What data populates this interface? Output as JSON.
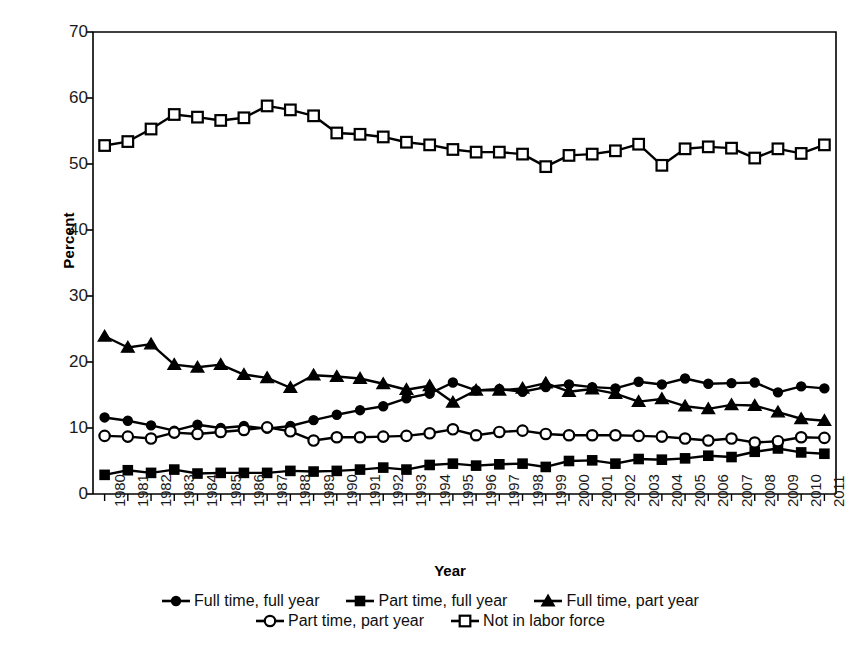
{
  "chart_data": {
    "type": "line",
    "title": "",
    "xlabel": "Year",
    "ylabel": "Percent",
    "ylim": [
      0,
      70
    ],
    "yticks": [
      0,
      10,
      20,
      30,
      40,
      50,
      60,
      70
    ],
    "grid": false,
    "legend_position": "bottom",
    "categories": [
      "1980",
      "1981",
      "1982",
      "1983",
      "1984",
      "1985",
      "1986",
      "1987",
      "1988",
      "1989",
      "1990",
      "1991",
      "1992",
      "1993",
      "1994",
      "1995",
      "1996",
      "1997",
      "1998",
      "1999",
      "2000",
      "2001",
      "2002",
      "2003",
      "2004",
      "2005",
      "2006",
      "2007",
      "2008",
      "2009",
      "2010",
      "2011"
    ],
    "series": [
      {
        "name": "Full time, full year",
        "marker": "filled-circle",
        "values": [
          11.6,
          11.1,
          10.4,
          9.6,
          10.5,
          10.0,
          10.3,
          9.9,
          10.3,
          11.2,
          12.0,
          12.7,
          13.3,
          14.5,
          15.2,
          16.9,
          15.7,
          15.9,
          15.5,
          16.2,
          16.6,
          16.2,
          16.0,
          17.0,
          16.6,
          17.5,
          16.7,
          16.8,
          16.9,
          15.4,
          16.3,
          16.0
        ]
      },
      {
        "name": "Part time, full year",
        "marker": "filled-square",
        "values": [
          2.9,
          3.6,
          3.2,
          3.7,
          3.1,
          3.2,
          3.2,
          3.2,
          3.5,
          3.4,
          3.5,
          3.7,
          4.0,
          3.7,
          4.4,
          4.6,
          4.3,
          4.5,
          4.6,
          4.1,
          5.0,
          5.1,
          4.6,
          5.3,
          5.2,
          5.4,
          5.8,
          5.6,
          6.4,
          6.9,
          6.3,
          6.1
        ]
      },
      {
        "name": "Full time, part year",
        "marker": "filled-triangle",
        "values": [
          23.9,
          22.2,
          22.7,
          19.6,
          19.2,
          19.6,
          18.1,
          17.6,
          16.1,
          18.0,
          17.8,
          17.5,
          16.7,
          15.8,
          16.4,
          13.9,
          15.7,
          15.7,
          16.0,
          16.8,
          15.5,
          15.9,
          15.2,
          14.0,
          14.4,
          13.3,
          12.9,
          13.5,
          13.4,
          12.4,
          11.4,
          11.1
        ]
      },
      {
        "name": "Part time, part year",
        "marker": "open-circle",
        "values": [
          8.8,
          8.7,
          8.4,
          9.3,
          9.1,
          9.4,
          9.7,
          10.1,
          9.5,
          8.1,
          8.6,
          8.6,
          8.7,
          8.8,
          9.2,
          9.8,
          8.9,
          9.4,
          9.6,
          9.1,
          8.9,
          8.9,
          8.9,
          8.8,
          8.7,
          8.4,
          8.1,
          8.4,
          7.8,
          8.0,
          8.6,
          8.5
        ]
      },
      {
        "name": "Not in labor force",
        "marker": "open-square",
        "values": [
          52.8,
          53.4,
          55.3,
          57.5,
          57.1,
          56.6,
          57.0,
          58.8,
          58.2,
          57.3,
          54.7,
          54.5,
          54.1,
          53.3,
          52.9,
          52.2,
          51.8,
          51.8,
          51.5,
          49.6,
          51.3,
          51.5,
          52.0,
          53.0,
          49.8,
          52.3,
          52.6,
          52.4,
          50.9,
          52.3,
          51.6,
          52.9
        ]
      }
    ]
  },
  "legend": {
    "rows": [
      [
        {
          "label": "Full time, full year",
          "marker": "filled-circle"
        },
        {
          "label": "Part time, full year",
          "marker": "filled-square"
        },
        {
          "label": "Full time, part year",
          "marker": "filled-triangle"
        }
      ],
      [
        {
          "label": "Part time, part year",
          "marker": "open-circle"
        },
        {
          "label": "Not in labor force",
          "marker": "open-square"
        }
      ]
    ]
  },
  "colors": {
    "ink": "#000000",
    "background": "#ffffff"
  }
}
